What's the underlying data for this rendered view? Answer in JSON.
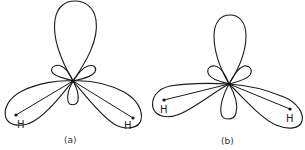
{
  "figure": {
    "panels": [
      {
        "id": "a",
        "caption": "(a)",
        "atoms": [
          {
            "label": "H",
            "side": "left"
          },
          {
            "label": "H",
            "side": "right"
          }
        ],
        "description": "Hybrid orbital lobes around central atom with two bonds to H; large upper lobe, two small lobes, one small lower lobe, two large bonding lobes"
      },
      {
        "id": "b",
        "caption": "(b)",
        "atoms": [
          {
            "label": "H",
            "side": "left"
          },
          {
            "label": "H",
            "side": "right"
          }
        ],
        "description": "Hybrid orbital lobes with bonds bent (lobes not aligned with bond lines); upper lobe, two small side lobes, lower lobe, two bonding lobes"
      }
    ],
    "colors": {
      "stroke": "#1a1a1a",
      "background": "#ffffff"
    }
  }
}
